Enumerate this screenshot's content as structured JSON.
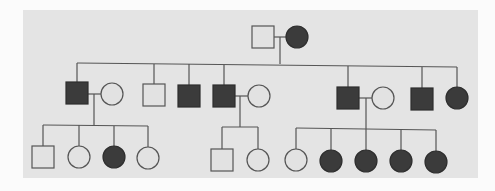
{
  "diagram": {
    "type": "pedigree",
    "colors": {
      "page_bg": "#fbfbfb",
      "panel_bg": "#e4e4e4",
      "affected_fill": "#3b3b3b",
      "unaffected_fill": "#e2e2e2",
      "line": "#555555"
    },
    "panel": {
      "x": 23,
      "y": 10,
      "w": 455,
      "h": 168
    },
    "symbol_size": 22,
    "individuals": [
      {
        "id": "I-1",
        "gen": 1,
        "sex": "male",
        "affected": false,
        "x": 263,
        "y": 37
      },
      {
        "id": "I-2",
        "gen": 1,
        "sex": "female",
        "affected": true,
        "x": 297,
        "y": 37
      },
      {
        "id": "II-1",
        "gen": 2,
        "sex": "male",
        "affected": true,
        "x": 77,
        "y": 93
      },
      {
        "id": "II-1s",
        "gen": 2,
        "sex": "female",
        "affected": false,
        "x": 112,
        "y": 94,
        "spouse": true
      },
      {
        "id": "II-2",
        "gen": 2,
        "sex": "male",
        "affected": false,
        "x": 154,
        "y": 95
      },
      {
        "id": "II-3",
        "gen": 2,
        "sex": "male",
        "affected": true,
        "x": 189,
        "y": 96
      },
      {
        "id": "II-4",
        "gen": 2,
        "sex": "male",
        "affected": true,
        "x": 224,
        "y": 96
      },
      {
        "id": "II-4s",
        "gen": 2,
        "sex": "female",
        "affected": false,
        "x": 259,
        "y": 96,
        "spouse": true
      },
      {
        "id": "II-5",
        "gen": 2,
        "sex": "male",
        "affected": true,
        "x": 348,
        "y": 98
      },
      {
        "id": "II-5s",
        "gen": 2,
        "sex": "female",
        "affected": false,
        "x": 383,
        "y": 98,
        "spouse": true
      },
      {
        "id": "II-6",
        "gen": 2,
        "sex": "male",
        "affected": true,
        "x": 422,
        "y": 99
      },
      {
        "id": "II-7",
        "gen": 2,
        "sex": "female",
        "affected": true,
        "x": 457,
        "y": 98
      },
      {
        "id": "III-1",
        "gen": 3,
        "sex": "male",
        "affected": false,
        "x": 43,
        "y": 157
      },
      {
        "id": "III-2",
        "gen": 3,
        "sex": "female",
        "affected": false,
        "x": 79,
        "y": 157
      },
      {
        "id": "III-3",
        "gen": 3,
        "sex": "female",
        "affected": true,
        "x": 114,
        "y": 157
      },
      {
        "id": "III-4",
        "gen": 3,
        "sex": "female",
        "affected": false,
        "x": 148,
        "y": 158
      },
      {
        "id": "III-5",
        "gen": 3,
        "sex": "male",
        "affected": false,
        "x": 222,
        "y": 160
      },
      {
        "id": "III-6",
        "gen": 3,
        "sex": "female",
        "affected": false,
        "x": 258,
        "y": 160
      },
      {
        "id": "III-7",
        "gen": 3,
        "sex": "female",
        "affected": false,
        "x": 296,
        "y": 160
      },
      {
        "id": "III-8",
        "gen": 3,
        "sex": "female",
        "affected": true,
        "x": 331,
        "y": 161
      },
      {
        "id": "III-9",
        "gen": 3,
        "sex": "female",
        "affected": true,
        "x": 366,
        "y": 161
      },
      {
        "id": "III-10",
        "gen": 3,
        "sex": "female",
        "affected": true,
        "x": 401,
        "y": 161
      },
      {
        "id": "III-11",
        "gen": 3,
        "sex": "female",
        "affected": true,
        "x": 436,
        "y": 162
      }
    ],
    "lines": [
      {
        "name": "marriage-I",
        "x1": 274,
        "y1": 37,
        "x2": 286,
        "y2": 37
      },
      {
        "name": "descent-I",
        "x1": 280,
        "y1": 37,
        "x2": 280,
        "y2": 64
      },
      {
        "name": "sibship-II",
        "x1": 77,
        "y1": 63,
        "x2": 457,
        "y2": 67
      },
      {
        "name": "drop-II-1",
        "x1": 77,
        "y1": 63,
        "x2": 77,
        "y2": 82
      },
      {
        "name": "drop-II-2",
        "x1": 154,
        "y1": 64,
        "x2": 154,
        "y2": 84
      },
      {
        "name": "drop-II-3",
        "x1": 189,
        "y1": 64,
        "x2": 189,
        "y2": 85
      },
      {
        "name": "drop-II-4",
        "x1": 224,
        "y1": 65,
        "x2": 224,
        "y2": 85
      },
      {
        "name": "drop-II-5",
        "x1": 348,
        "y1": 66,
        "x2": 348,
        "y2": 87
      },
      {
        "name": "drop-II-6",
        "x1": 422,
        "y1": 67,
        "x2": 422,
        "y2": 88
      },
      {
        "name": "drop-II-7",
        "x1": 457,
        "y1": 67,
        "x2": 457,
        "y2": 87
      },
      {
        "name": "marriage-II-1",
        "x1": 88,
        "y1": 94,
        "x2": 101,
        "y2": 94
      },
      {
        "name": "descent-II-1",
        "x1": 94,
        "y1": 94,
        "x2": 94,
        "y2": 125
      },
      {
        "name": "sibship-III-a",
        "x1": 43,
        "y1": 125,
        "x2": 148,
        "y2": 126
      },
      {
        "name": "drop-III-1",
        "x1": 43,
        "y1": 125,
        "x2": 43,
        "y2": 146
      },
      {
        "name": "drop-III-2",
        "x1": 79,
        "y1": 125,
        "x2": 79,
        "y2": 146
      },
      {
        "name": "drop-III-3",
        "x1": 114,
        "y1": 126,
        "x2": 114,
        "y2": 146
      },
      {
        "name": "drop-III-4",
        "x1": 148,
        "y1": 126,
        "x2": 148,
        "y2": 147
      },
      {
        "name": "marriage-II-4",
        "x1": 235,
        "y1": 96,
        "x2": 248,
        "y2": 96
      },
      {
        "name": "descent-II-4",
        "x1": 240,
        "y1": 96,
        "x2": 240,
        "y2": 127
      },
      {
        "name": "sibship-III-b",
        "x1": 222,
        "y1": 127,
        "x2": 258,
        "y2": 127
      },
      {
        "name": "drop-III-5",
        "x1": 222,
        "y1": 127,
        "x2": 222,
        "y2": 149
      },
      {
        "name": "drop-III-6",
        "x1": 258,
        "y1": 127,
        "x2": 258,
        "y2": 149
      },
      {
        "name": "marriage-II-5",
        "x1": 359,
        "y1": 98,
        "x2": 372,
        "y2": 98
      },
      {
        "name": "descent-II-5",
        "x1": 366,
        "y1": 98,
        "x2": 366,
        "y2": 150
      },
      {
        "name": "sibship-III-c",
        "x1": 296,
        "y1": 128,
        "x2": 436,
        "y2": 130
      },
      {
        "name": "drop-III-7",
        "x1": 296,
        "y1": 128,
        "x2": 296,
        "y2": 149
      },
      {
        "name": "drop-III-8",
        "x1": 331,
        "y1": 129,
        "x2": 331,
        "y2": 150
      },
      {
        "name": "drop-III-10",
        "x1": 401,
        "y1": 129,
        "x2": 401,
        "y2": 150
      },
      {
        "name": "drop-III-11",
        "x1": 436,
        "y1": 130,
        "x2": 436,
        "y2": 151
      }
    ]
  }
}
